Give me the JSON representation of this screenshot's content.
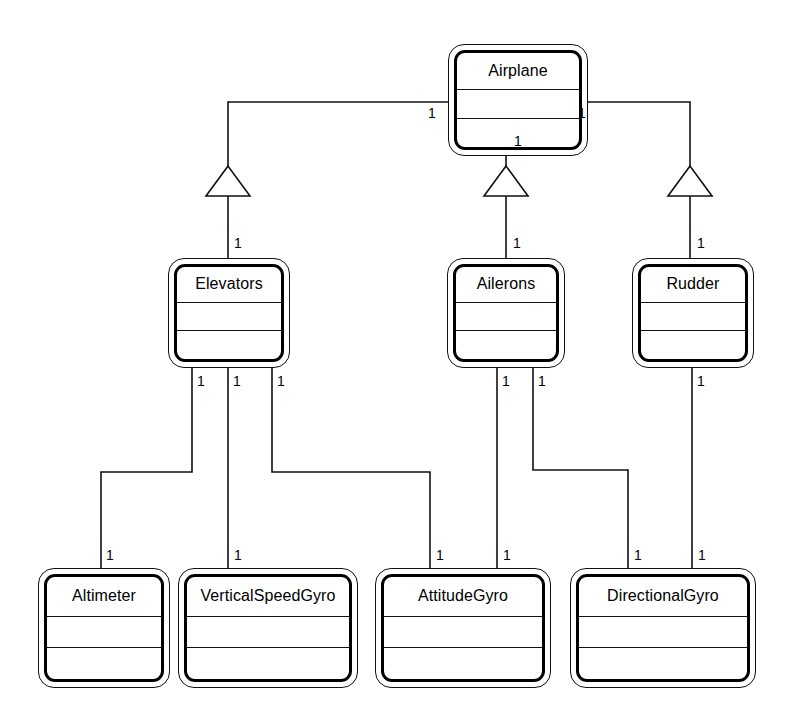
{
  "diagram": {
    "type": "uml-class-diagram",
    "background": "#ffffff",
    "line_color": "#111111",
    "relationship_kind": "generalization"
  },
  "classes": [
    {
      "id": "airplane",
      "name": "Airplane",
      "x": 448,
      "y": 44,
      "w": 140,
      "h": 112
    },
    {
      "id": "elevators",
      "name": "Elevators",
      "x": 168,
      "y": 258,
      "w": 122,
      "h": 110
    },
    {
      "id": "ailerons",
      "name": "Ailerons",
      "x": 447,
      "y": 258,
      "w": 118,
      "h": 110
    },
    {
      "id": "rudder",
      "name": "Rudder",
      "x": 632,
      "y": 258,
      "w": 122,
      "h": 110
    },
    {
      "id": "altimeter",
      "name": "Altimeter",
      "x": 38,
      "y": 568,
      "w": 132,
      "h": 120
    },
    {
      "id": "verticalspeedgyro",
      "name": "VerticalSpeedGyro",
      "x": 178,
      "y": 568,
      "w": 180,
      "h": 120
    },
    {
      "id": "attitudegyro",
      "name": "AttitudeGyro",
      "x": 375,
      "y": 568,
      "w": 176,
      "h": 120
    },
    {
      "id": "directionalgyro",
      "name": "DirectionalGyro",
      "x": 570,
      "y": 568,
      "w": 186,
      "h": 120
    }
  ],
  "edges": [
    {
      "id": "airplane-elevators",
      "from": "airplane",
      "to": "elevators",
      "points": "228,102 228,196",
      "elbow": "448,102 228,102 228,196",
      "triangle_at": {
        "x": 228,
        "y": 196
      },
      "source_mult": {
        "text": "1",
        "x": 432,
        "y": 108
      },
      "target_mult": {
        "text": "1",
        "x": 234,
        "y": 240
      }
    },
    {
      "id": "airplane-ailerons",
      "from": "airplane",
      "to": "ailerons",
      "elbow": "506,156 506,196",
      "triangle_at": {
        "x": 506,
        "y": 196
      },
      "source_mult": {
        "text": "1",
        "x": 514,
        "y": 140
      },
      "target_mult": {
        "text": "1",
        "x": 514,
        "y": 240
      }
    },
    {
      "id": "airplane-rudder",
      "from": "airplane",
      "to": "rudder",
      "elbow": "588,102 690,102 690,196",
      "triangle_at": {
        "x": 690,
        "y": 196
      },
      "source_mult": {
        "text": "1",
        "x": 578,
        "y": 108
      },
      "target_mult": {
        "text": "1",
        "x": 697,
        "y": 240
      }
    },
    {
      "id": "elevators-altimeter",
      "from": "elevators",
      "to": "altimeter",
      "elbow": "192,368 192,472 101,472 101,568",
      "source_mult": {
        "text": "1",
        "x": 197,
        "y": 378
      },
      "target_mult": {
        "text": "1",
        "x": 106,
        "y": 552
      }
    },
    {
      "id": "elevators-verticalspeedgyro",
      "from": "elevators",
      "to": "verticalspeedgyro",
      "elbow": "228,368 228,568",
      "source_mult": {
        "text": "1",
        "x": 234,
        "y": 378
      },
      "target_mult": {
        "text": "1",
        "x": 234,
        "y": 552
      }
    },
    {
      "id": "elevators-attitudegyro",
      "from": "elevators",
      "to": "attitudegyro",
      "elbow": "272,368 272,472 430,472 430,568",
      "source_mult": {
        "text": "1",
        "x": 278,
        "y": 378
      },
      "target_mult": {
        "text": "1",
        "x": 436,
        "y": 552
      }
    },
    {
      "id": "ailerons-attitudegyro",
      "from": "ailerons",
      "to": "attitudegyro",
      "elbow": "497,368 497,568",
      "source_mult": {
        "text": "1",
        "x": 503,
        "y": 378
      },
      "target_mult": {
        "text": "1",
        "x": 503,
        "y": 552
      }
    },
    {
      "id": "ailerons-directionalgyro",
      "from": "ailerons",
      "to": "directionalgyro",
      "elbow": "533,368 533,470 628,470 628,568",
      "source_mult": {
        "text": "1",
        "x": 539,
        "y": 378
      },
      "target_mult": {
        "text": "1",
        "x": 634,
        "y": 552
      }
    },
    {
      "id": "rudder-directionalgyro",
      "from": "rudder",
      "to": "directionalgyro",
      "elbow": "692,368 692,568",
      "source_mult": {
        "text": "1",
        "x": 698,
        "y": 378
      },
      "target_mult": {
        "text": "1",
        "x": 698,
        "y": 552
      }
    }
  ],
  "multiplicities": [
    {
      "id": "m-airplane-left",
      "text": "1",
      "x": 428,
      "y": 106
    },
    {
      "id": "m-airplane-right",
      "text": "1",
      "x": 578,
      "y": 106
    },
    {
      "id": "m-airplane-bottom",
      "text": "1",
      "x": 514,
      "y": 134
    },
    {
      "id": "m-elevators-top",
      "text": "1",
      "x": 234,
      "y": 236
    },
    {
      "id": "m-ailerons-top",
      "text": "1",
      "x": 513,
      "y": 236
    },
    {
      "id": "m-rudder-top",
      "text": "1",
      "x": 697,
      "y": 236
    },
    {
      "id": "m-elev-b1",
      "text": "1",
      "x": 197,
      "y": 374
    },
    {
      "id": "m-elev-b2",
      "text": "1",
      "x": 233,
      "y": 374
    },
    {
      "id": "m-elev-b3",
      "text": "1",
      "x": 277,
      "y": 374
    },
    {
      "id": "m-ail-b1",
      "text": "1",
      "x": 502,
      "y": 374
    },
    {
      "id": "m-ail-b2",
      "text": "1",
      "x": 538,
      "y": 374
    },
    {
      "id": "m-rud-b1",
      "text": "1",
      "x": 697,
      "y": 374
    },
    {
      "id": "m-altimeter-top",
      "text": "1",
      "x": 106,
      "y": 548
    },
    {
      "id": "m-vsg-top",
      "text": "1",
      "x": 234,
      "y": 548
    },
    {
      "id": "m-att-top-1",
      "text": "1",
      "x": 436,
      "y": 548
    },
    {
      "id": "m-att-top-2",
      "text": "1",
      "x": 503,
      "y": 548
    },
    {
      "id": "m-dir-top-1",
      "text": "1",
      "x": 634,
      "y": 548
    },
    {
      "id": "m-dir-top-2",
      "text": "1",
      "x": 698,
      "y": 548
    }
  ]
}
